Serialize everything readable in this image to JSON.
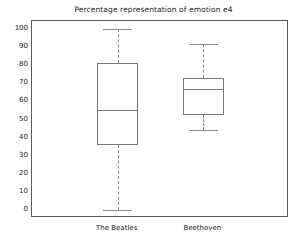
{
  "chart_data": {
    "type": "box",
    "title": "Percentage representation of emotion e4",
    "xlabel": "",
    "ylabel": "",
    "ylim": [
      0,
      100
    ],
    "yticks": [
      0,
      10,
      20,
      30,
      40,
      50,
      60,
      70,
      80,
      90,
      100
    ],
    "grid": false,
    "legend": "none",
    "categories": [
      "The Beatles",
      "Beethoven"
    ],
    "boxes": [
      {
        "name": "The Beatles",
        "whisker_low": 0,
        "q1": 36,
        "median": 55.5,
        "q3": 81,
        "whisker_high": 100
      },
      {
        "name": "Beethoven",
        "whisker_low": 44,
        "q1": 52.5,
        "median": 67,
        "q3": 73,
        "whisker_high": 91.5
      }
    ]
  },
  "style": {
    "box_edge_color": "#777777",
    "whisker_color": "#8a8a8a",
    "axis_color": "#5a5a5a",
    "text_color": "#1a1a1a",
    "background": "#ffffff"
  }
}
